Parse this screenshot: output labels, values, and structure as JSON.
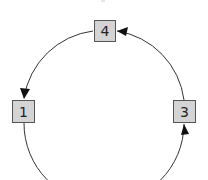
{
  "diagram": {
    "type": "cycle",
    "nodes": [
      {
        "id": "4",
        "label": "4",
        "position": "top"
      },
      {
        "id": "1",
        "label": "1",
        "position": "left"
      },
      {
        "id": "3",
        "label": "3",
        "position": "right"
      }
    ],
    "edges": [
      {
        "from": "3",
        "to": "4",
        "direction": "counterclockwise"
      },
      {
        "from": "4",
        "to": "1",
        "direction": "counterclockwise"
      },
      {
        "from": "1",
        "to": "3",
        "direction": "counterclockwise",
        "note": "bottom arc continues off-image"
      }
    ],
    "colors": {
      "node_fill": "#d4d4d4",
      "node_border": "#555555",
      "edge": "#333333",
      "arrowhead": "#111111"
    }
  }
}
